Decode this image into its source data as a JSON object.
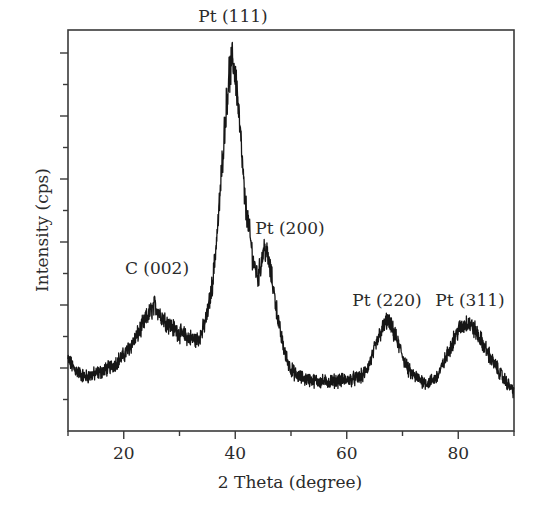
{
  "chart_data": {
    "type": "line",
    "title": "",
    "xlabel": "2 Theta (degree)",
    "ylabel": "Intensity (cps)",
    "xlim": [
      10,
      90
    ],
    "ylim": [
      0,
      6.33
    ],
    "x_ticks_major": [
      20,
      40,
      60,
      80
    ],
    "x_ticks_minor": [
      10,
      30,
      50,
      70,
      90
    ],
    "y_ticks_major_count": 7,
    "y_tick_labels_shown": false,
    "grid": false,
    "legend": null,
    "line_color": "#1a1a1a",
    "series": [
      {
        "name": "XRD pattern",
        "x": [
          10,
          11,
          12,
          13,
          14,
          16,
          18,
          20,
          22,
          24,
          25,
          25.6,
          26.5,
          28,
          30,
          32,
          33,
          34,
          35,
          36,
          37,
          38,
          38.8,
          39.6,
          40.3,
          41,
          41.7,
          42.5,
          43.2,
          44.1,
          44.6,
          45.2,
          45.8,
          46.6,
          47.3,
          48,
          49,
          50,
          51,
          52,
          54,
          56,
          58,
          60,
          62,
          63,
          64,
          65,
          66,
          67.3,
          68.5,
          70,
          71,
          72,
          73,
          74.5,
          76,
          77,
          78,
          79,
          80,
          81.7,
          83,
          84,
          86,
          88,
          90
        ],
        "y": [
          1.13,
          1.0,
          0.92,
          0.86,
          0.88,
          0.94,
          1.04,
          1.2,
          1.45,
          1.78,
          1.92,
          2.0,
          1.86,
          1.7,
          1.55,
          1.47,
          1.44,
          1.55,
          1.85,
          2.4,
          3.4,
          4.7,
          5.6,
          5.9,
          5.45,
          4.6,
          3.67,
          3.2,
          2.7,
          2.44,
          2.65,
          2.92,
          2.78,
          2.4,
          2.0,
          1.6,
          1.2,
          0.98,
          0.88,
          0.84,
          0.8,
          0.78,
          0.8,
          0.81,
          0.84,
          0.89,
          1.05,
          1.3,
          1.55,
          1.76,
          1.55,
          1.2,
          0.97,
          0.88,
          0.82,
          0.76,
          0.84,
          1.0,
          1.2,
          1.42,
          1.6,
          1.73,
          1.6,
          1.45,
          1.13,
          0.85,
          0.62
        ]
      }
    ],
    "annotations": [
      {
        "text": "C (002)",
        "x": 25.6,
        "label_px": [
          157,
          258
        ]
      },
      {
        "text": "Pt (111)",
        "x": 39.6,
        "label_px": [
          233,
          6
        ]
      },
      {
        "text": "Pt (200)",
        "x": 45.2,
        "label_px": [
          290,
          218
        ]
      },
      {
        "text": "Pt (220)",
        "x": 67.3,
        "label_px": [
          387,
          290
        ]
      },
      {
        "text": "Pt (311)",
        "x": 81.7,
        "label_px": [
          470,
          290
        ]
      }
    ]
  },
  "labels": {
    "x_axis": "2 Theta (degree)",
    "y_axis": "Intensity (cps)",
    "x_tick_labels": [
      "20",
      "40",
      "60",
      "80"
    ],
    "peaks": [
      "C (002)",
      "Pt (111)",
      "Pt (200)",
      "Pt (220)",
      "Pt (311)"
    ]
  }
}
